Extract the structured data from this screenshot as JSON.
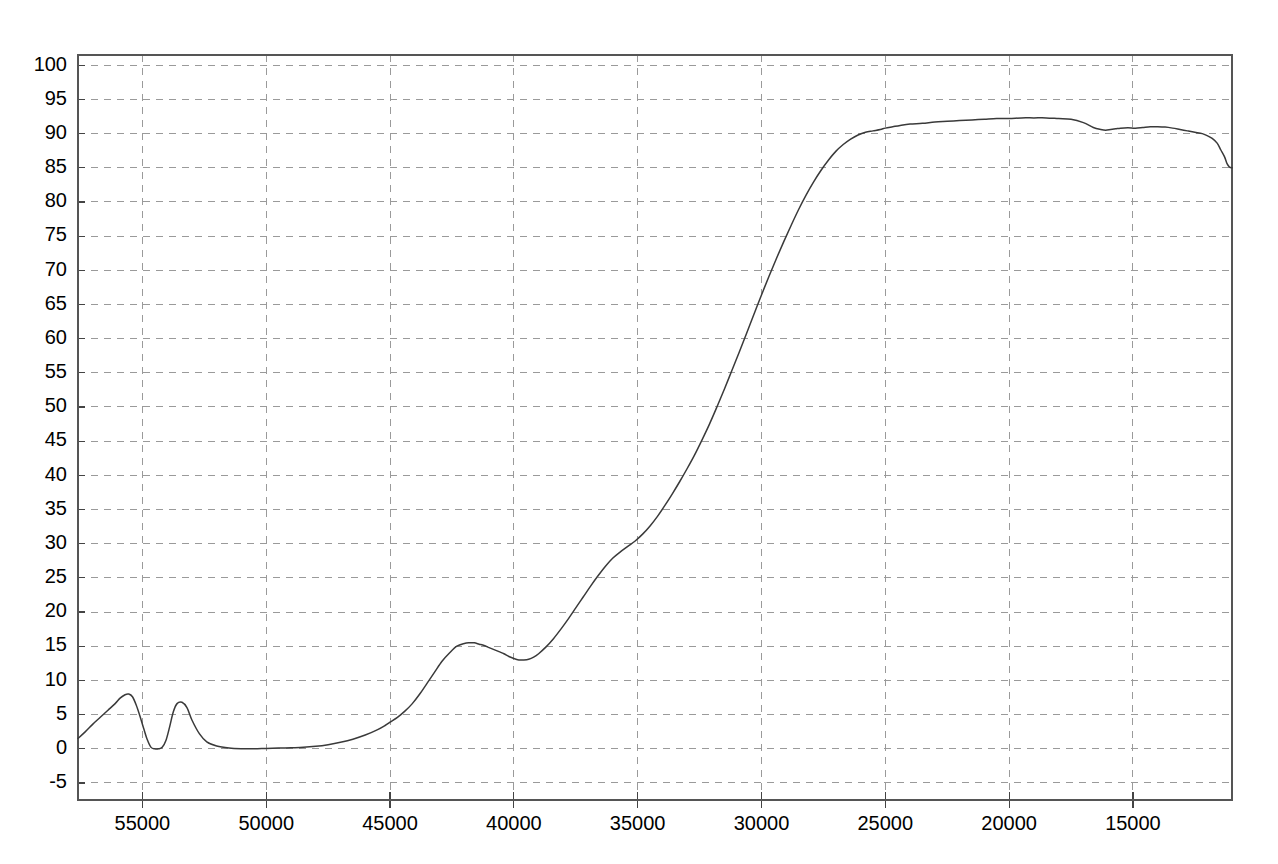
{
  "chart_data": {
    "type": "line",
    "title": "",
    "subtitle": "",
    "xlabel": "",
    "ylabel": "",
    "xlim": [
      57600,
      11000
    ],
    "ylim": [
      -7.5,
      101.5
    ],
    "x_axis_reversed": true,
    "grid": true,
    "legend": null,
    "legend_position": "none",
    "line_color": "#3a3a3a",
    "grid_color": "#9a9a9a",
    "background_color": "#ffffff",
    "xticks": [
      55000,
      50000,
      45000,
      40000,
      35000,
      30000,
      25000,
      20000,
      15000
    ],
    "xticklabels": [
      "55000",
      "50000",
      "45000",
      "40000",
      "35000",
      "30000",
      "25000",
      "20000",
      "15000"
    ],
    "yticks": [
      -5,
      0,
      5,
      10,
      15,
      20,
      25,
      30,
      35,
      40,
      45,
      50,
      55,
      60,
      65,
      70,
      75,
      80,
      85,
      90,
      95,
      100
    ],
    "yticklabels": [
      "-5",
      "0",
      "5",
      "10",
      "15",
      "20",
      "25",
      "30",
      "35",
      "40",
      "45",
      "50",
      "55",
      "60",
      "65",
      "70",
      "75",
      "80",
      "85",
      "90",
      "95",
      "100"
    ],
    "series": [
      {
        "name": "transmittance",
        "x": [
          57600,
          57300,
          57000,
          56700,
          56400,
          56100,
          55900,
          55700,
          55550,
          55400,
          55250,
          55100,
          54950,
          54800,
          54650,
          54500,
          54350,
          54200,
          54050,
          53900,
          53750,
          53600,
          53400,
          53200,
          53000,
          52700,
          52400,
          52000,
          51500,
          51000,
          50500,
          50000,
          49500,
          49000,
          48500,
          48000,
          47500,
          47000,
          46500,
          46000,
          45500,
          45200,
          45000,
          44700,
          44400,
          44100,
          43800,
          43500,
          43200,
          42900,
          42600,
          42300,
          42000,
          41800,
          41600,
          41400,
          41200,
          41000,
          40800,
          40600,
          40400,
          40200,
          40000,
          39800,
          39600,
          39400,
          39200,
          39000,
          38700,
          38400,
          38100,
          37800,
          37500,
          37200,
          36900,
          36600,
          36300,
          36000,
          35700,
          35400,
          35100,
          34800,
          34500,
          34200,
          33900,
          33600,
          33300,
          33000,
          32700,
          32400,
          32100,
          31800,
          31500,
          31200,
          30900,
          30600,
          30300,
          30000,
          29700,
          29400,
          29100,
          28800,
          28500,
          28200,
          27900,
          27600,
          27300,
          27000,
          26700,
          26400,
          26100,
          25800,
          25500,
          25200,
          25000,
          24700,
          24400,
          24000,
          23500,
          23000,
          22500,
          22000,
          21500,
          21000,
          20500,
          20000,
          19500,
          19000,
          18500,
          18000,
          17500,
          17000,
          16600,
          16300,
          16100,
          15900,
          15700,
          15500,
          15200,
          14900,
          14600,
          14300,
          14000,
          13700,
          13400,
          13100,
          12800,
          12500,
          12200,
          12000,
          11800,
          11600,
          11450,
          11300,
          11200,
          11100,
          11000
        ],
        "y": [
          1.5,
          2.5,
          3.6,
          4.6,
          5.6,
          6.6,
          7.4,
          7.9,
          8.0,
          7.6,
          6.4,
          4.8,
          3.0,
          1.3,
          0.2,
          0.0,
          0.0,
          0.2,
          1.2,
          3.2,
          5.4,
          6.6,
          6.8,
          6.0,
          4.2,
          2.2,
          1.0,
          0.4,
          0.1,
          0.0,
          0.0,
          0.05,
          0.1,
          0.15,
          0.2,
          0.35,
          0.6,
          0.95,
          1.4,
          2.0,
          2.8,
          3.4,
          3.9,
          4.6,
          5.5,
          6.6,
          8.0,
          9.6,
          11.2,
          12.8,
          14.0,
          15.0,
          15.4,
          15.5,
          15.5,
          15.3,
          15.1,
          14.8,
          14.5,
          14.2,
          13.9,
          13.5,
          13.2,
          13.0,
          13.0,
          13.1,
          13.4,
          13.9,
          14.9,
          16.1,
          17.5,
          19.0,
          20.6,
          22.2,
          23.8,
          25.3,
          26.7,
          27.9,
          28.8,
          29.6,
          30.4,
          31.4,
          32.6,
          34.0,
          35.6,
          37.3,
          39.1,
          41.0,
          43.0,
          45.2,
          47.5,
          50.0,
          52.6,
          55.3,
          58.0,
          60.8,
          63.6,
          66.4,
          69.1,
          71.7,
          74.2,
          76.6,
          78.9,
          81.0,
          82.9,
          84.6,
          86.1,
          87.4,
          88.4,
          89.2,
          89.8,
          90.2,
          90.4,
          90.6,
          90.8,
          91.0,
          91.2,
          91.4,
          91.5,
          91.7,
          91.8,
          91.9,
          92.0,
          92.1,
          92.2,
          92.2,
          92.3,
          92.3,
          92.3,
          92.2,
          92.1,
          91.6,
          90.9,
          90.6,
          90.5,
          90.6,
          90.7,
          90.8,
          90.85,
          90.8,
          90.9,
          91.0,
          91.0,
          90.95,
          90.8,
          90.6,
          90.4,
          90.2,
          90.0,
          89.7,
          89.3,
          88.6,
          87.6,
          86.6,
          85.6,
          85.1,
          85.0
        ]
      }
    ],
    "annotations": [
      {
        "label": "first-uv-peak",
        "x": 55550,
        "y": 8.0
      },
      {
        "label": "second-uv-peak",
        "x": 53400,
        "y": 6.8
      },
      {
        "label": "local-maximum",
        "x": 41700,
        "y": 15.5
      },
      {
        "label": "local-minimum",
        "x": 39900,
        "y": 13.0
      },
      {
        "label": "plateau-maximum",
        "x": 16600,
        "y": 92.3
      },
      {
        "label": "right-edge-drop",
        "x": 11100,
        "y": 85.0
      }
    ]
  },
  "plot_geometry": {
    "left": 78,
    "top": 55,
    "right": 1232,
    "bottom": 800
  }
}
